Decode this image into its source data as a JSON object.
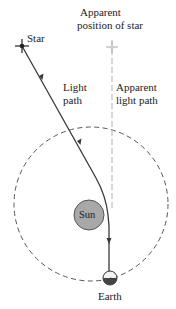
{
  "labels": {
    "star": "Star",
    "apparent_position_line1": "Apparent",
    "apparent_position_line2": "position of star",
    "light_path_line1": "Light",
    "light_path_line2": "path",
    "apparent_light_path_line1": "Apparent",
    "apparent_light_path_line2": "light path",
    "sun": "Sun",
    "earth": "Earth"
  },
  "colors": {
    "background": "#ffffff",
    "light_path": "#3a3a3a",
    "apparent_path": "#c4c4c4",
    "orbit": "#555555",
    "sun_fill": "#a8a8a8",
    "sun_stroke": "#555555",
    "earth_dark": "#444444",
    "earth_light": "#f2f2f2",
    "text": "#222222"
  }
}
